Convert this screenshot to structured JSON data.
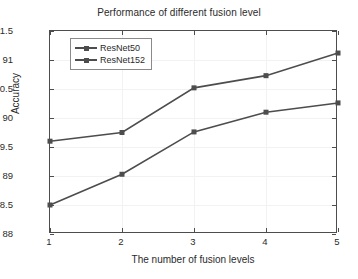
{
  "chart_data": {
    "type": "line",
    "title": "Performance of different fusion level",
    "xlabel": "The number of fusion levels",
    "ylabel": "Accuracy",
    "x": [
      1,
      2,
      3,
      4,
      5
    ],
    "categories": [
      "1",
      "2",
      "3",
      "4",
      "5"
    ],
    "xtick_labels": [
      "1",
      "2",
      "3",
      "4",
      "5"
    ],
    "ytick_labels": [
      "88",
      "88.5",
      "89",
      "89.5",
      "90",
      "90.5",
      "91",
      "91.5"
    ],
    "ytick_values": [
      88,
      88.5,
      89,
      89.5,
      90,
      90.5,
      91,
      91.5
    ],
    "xlim": [
      1,
      5
    ],
    "ylim": [
      88,
      91.5
    ],
    "grid": true,
    "legend_position": "upper left",
    "series": [
      {
        "name": "ResNet50",
        "values": [
          88.5,
          89.03,
          89.76,
          90.1,
          90.26
        ],
        "color": "#4d4d4d",
        "marker": "square"
      },
      {
        "name": "ResNet152",
        "values": [
          89.6,
          89.75,
          90.52,
          90.73,
          91.12
        ],
        "color": "#4d4d4d",
        "marker": "square"
      }
    ]
  }
}
